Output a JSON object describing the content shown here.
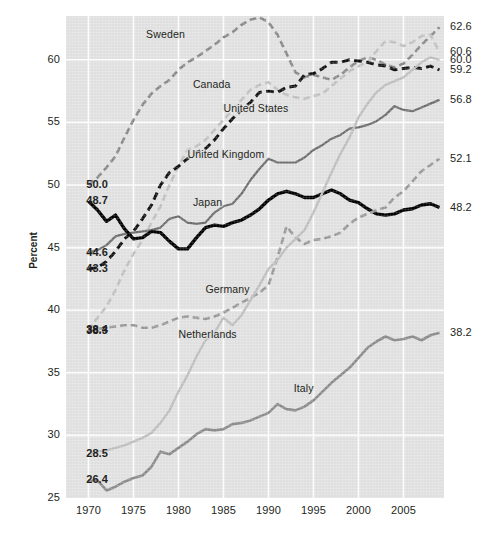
{
  "chart_data": {
    "type": "line",
    "title": "",
    "xlabel": "",
    "ylabel": "Percent",
    "xlim": [
      1967.5,
      2009.5
    ],
    "ylim": [
      25,
      63.5
    ],
    "xticks": [
      "1970",
      "1975",
      "1980",
      "1985",
      "1990",
      "1995",
      "2000",
      "2005"
    ],
    "xtick_values": [
      1970,
      1975,
      1980,
      1985,
      1990,
      1995,
      2000,
      2005
    ],
    "yticks": [
      "25",
      "30",
      "35",
      "40",
      "45",
      "50",
      "55",
      "60"
    ],
    "ytick_values": [
      25,
      30,
      35,
      40,
      45,
      50,
      55,
      60
    ],
    "grid": true,
    "legend": "inline-labels",
    "panel_color": "#e3e3e3",
    "grid_color": "#ffffff",
    "series": [
      {
        "name": "Sweden",
        "color": "#8a8a8a",
        "style": "dashed",
        "width": 2.6,
        "label_x": 1976.4,
        "label_y": 62.0,
        "start_label": "",
        "end_label": "62.6",
        "x": [
          1970,
          1971,
          1972,
          1973,
          1974,
          1975,
          1976,
          1977,
          1978,
          1979,
          1980,
          1981,
          1982,
          1983,
          1984,
          1985,
          1986,
          1987,
          1988,
          1989,
          1990,
          1991,
          1992,
          1993,
          1994,
          1995,
          1996,
          1997,
          1998,
          1999,
          2000,
          2001,
          2002,
          2003,
          2004,
          2005,
          2006,
          2007,
          2008,
          2009
        ],
        "values": [
          50.0,
          50.6,
          51.4,
          52.3,
          53.8,
          55.2,
          56.4,
          57.3,
          57.9,
          58.4,
          59.2,
          59.8,
          60.2,
          60.7,
          61.2,
          61.8,
          62.2,
          62.8,
          63.2,
          63.4,
          63.0,
          62.0,
          60.5,
          59.0,
          58.6,
          58.8,
          58.6,
          58.4,
          58.8,
          59.4,
          59.9,
          60.2,
          60.0,
          59.6,
          59.4,
          59.7,
          60.4,
          61.2,
          61.9,
          62.6
        ]
      },
      {
        "name": "Canada",
        "color": "#c2c2c2",
        "style": "dashed",
        "width": 2.6,
        "label_x": 1981.6,
        "label_y": 58.0,
        "start_label": "38.4",
        "end_label": "60.6",
        "x": [
          1970,
          1971,
          1972,
          1973,
          1974,
          1975,
          1976,
          1977,
          1978,
          1979,
          1980,
          1981,
          1982,
          1983,
          1984,
          1985,
          1986,
          1987,
          1988,
          1989,
          1990,
          1991,
          1992,
          1993,
          1994,
          1995,
          1996,
          1997,
          1998,
          1999,
          2000,
          2001,
          2002,
          2003,
          2004,
          2005,
          2006,
          2007,
          2008,
          2009
        ],
        "values": [
          38.4,
          39.4,
          40.3,
          41.6,
          43.2,
          44.5,
          45.6,
          47.0,
          48.3,
          50.0,
          51.5,
          52.8,
          53.1,
          53.6,
          54.4,
          55.2,
          56.0,
          56.8,
          57.6,
          58.0,
          58.2,
          57.6,
          57.2,
          57.0,
          56.9,
          57.1,
          57.3,
          57.9,
          58.5,
          59.1,
          59.5,
          59.8,
          60.7,
          61.5,
          61.4,
          61.1,
          61.4,
          61.9,
          62.0,
          60.6
        ]
      },
      {
        "name": "United States",
        "color": "#111111",
        "style": "dashed",
        "width": 3.0,
        "label_x": 1985.0,
        "label_y": 56.1,
        "start_label": "43.3",
        "end_label": "59.2",
        "x": [
          1970,
          1971,
          1972,
          1973,
          1974,
          1975,
          1976,
          1977,
          1978,
          1979,
          1980,
          1981,
          1982,
          1983,
          1984,
          1985,
          1986,
          1987,
          1988,
          1989,
          1990,
          1991,
          1992,
          1993,
          1994,
          1995,
          1996,
          1997,
          1998,
          1999,
          2000,
          2001,
          2002,
          2003,
          2004,
          2005,
          2006,
          2007,
          2008,
          2009
        ],
        "values": [
          43.3,
          43.4,
          43.9,
          44.7,
          45.7,
          46.3,
          47.3,
          48.4,
          50.0,
          51.0,
          51.5,
          52.1,
          52.6,
          52.9,
          53.6,
          54.5,
          55.3,
          56.0,
          56.6,
          57.4,
          57.5,
          57.4,
          57.8,
          57.9,
          58.8,
          58.9,
          59.3,
          59.8,
          59.8,
          60.0,
          59.9,
          59.8,
          59.6,
          59.5,
          59.2,
          59.3,
          59.4,
          59.3,
          59.5,
          59.2
        ]
      },
      {
        "name": "United Kingdom",
        "color": "#6e6e6e",
        "style": "solid",
        "width": 2.2,
        "label_x": 1981.0,
        "label_y": 52.4,
        "start_label": "44.6",
        "end_label": "56.8",
        "x": [
          1970,
          1971,
          1972,
          1973,
          1974,
          1975,
          1976,
          1977,
          1978,
          1979,
          1980,
          1981,
          1982,
          1983,
          1984,
          1985,
          1986,
          1987,
          1988,
          1989,
          1990,
          1991,
          1992,
          1993,
          1994,
          1995,
          1996,
          1997,
          1998,
          1999,
          2000,
          2001,
          2002,
          2003,
          2004,
          2005,
          2006,
          2007,
          2008,
          2009
        ],
        "values": [
          44.6,
          44.8,
          45.2,
          45.9,
          46.1,
          46.2,
          46.3,
          46.4,
          46.6,
          47.3,
          47.5,
          47.0,
          46.9,
          47.0,
          47.8,
          48.3,
          48.5,
          49.3,
          50.4,
          51.3,
          52.1,
          51.8,
          51.8,
          51.8,
          52.2,
          52.8,
          53.2,
          53.7,
          54.0,
          54.5,
          54.6,
          54.8,
          55.1,
          55.6,
          56.3,
          56.0,
          55.9,
          56.2,
          56.5,
          56.8
        ]
      },
      {
        "name": "Japan",
        "color": "#000000",
        "style": "solid",
        "width": 3.4,
        "label_x": 1981.6,
        "label_y": 48.6,
        "start_label": "48.7",
        "end_label": "48.2",
        "x": [
          1970,
          1971,
          1972,
          1973,
          1974,
          1975,
          1976,
          1977,
          1978,
          1979,
          1980,
          1981,
          1982,
          1983,
          1984,
          1985,
          1986,
          1987,
          1988,
          1989,
          1990,
          1991,
          1992,
          1993,
          1994,
          1995,
          1996,
          1997,
          1998,
          1999,
          2000,
          2001,
          2002,
          2003,
          2004,
          2005,
          2006,
          2007,
          2008,
          2009
        ],
        "values": [
          48.7,
          48.0,
          47.1,
          47.6,
          46.5,
          45.7,
          45.8,
          46.3,
          46.2,
          45.5,
          44.9,
          44.9,
          45.8,
          46.6,
          46.8,
          46.7,
          47.0,
          47.2,
          47.6,
          48.1,
          48.8,
          49.3,
          49.5,
          49.3,
          49.0,
          49.0,
          49.3,
          49.6,
          49.3,
          48.8,
          48.6,
          48.1,
          47.7,
          47.6,
          47.7,
          48.0,
          48.1,
          48.4,
          48.5,
          48.2
        ]
      },
      {
        "name": "Germany",
        "color": "#9a9a9a",
        "style": "dashed",
        "width": 2.6,
        "label_x": 1983.0,
        "label_y": 41.6,
        "start_label": "38.3",
        "end_label": "52.1",
        "x": [
          1970,
          1971,
          1972,
          1973,
          1974,
          1975,
          1976,
          1977,
          1978,
          1979,
          1980,
          1981,
          1982,
          1983,
          1984,
          1985,
          1986,
          1987,
          1988,
          1989,
          1990,
          1991,
          1992,
          1993,
          1994,
          1995,
          1996,
          1997,
          1998,
          1999,
          2000,
          2001,
          2002,
          2003,
          2004,
          2005,
          2006,
          2007,
          2008,
          2009
        ],
        "values": [
          38.3,
          38.5,
          38.6,
          38.7,
          38.8,
          38.8,
          38.6,
          38.6,
          38.8,
          39.1,
          39.4,
          39.5,
          39.4,
          39.3,
          39.5,
          39.8,
          40.2,
          40.6,
          41.0,
          41.4,
          42.0,
          44.2,
          46.7,
          45.8,
          45.3,
          45.6,
          45.7,
          45.9,
          46.2,
          46.9,
          47.4,
          47.7,
          48.0,
          48.2,
          49.0,
          49.5,
          50.3,
          51.1,
          51.6,
          52.1
        ]
      },
      {
        "name": "Netherlands",
        "color": "#c0c0c0",
        "style": "solid",
        "width": 2.4,
        "label_x": 1980.0,
        "label_y": 38.0,
        "start_label": "28.5",
        "end_label": "60.0",
        "x": [
          1970,
          1971,
          1972,
          1973,
          1974,
          1975,
          1976,
          1977,
          1978,
          1979,
          1980,
          1981,
          1982,
          1983,
          1984,
          1985,
          1986,
          1987,
          1988,
          1989,
          1990,
          1991,
          1992,
          1993,
          1994,
          1995,
          1996,
          1997,
          1998,
          1999,
          2000,
          2001,
          2002,
          2003,
          2004,
          2005,
          2006,
          2007,
          2008,
          2009
        ],
        "values": [
          28.5,
          28.7,
          28.8,
          29.0,
          29.2,
          29.5,
          29.8,
          30.2,
          31.0,
          32.0,
          33.5,
          34.8,
          36.3,
          37.6,
          38.2,
          39.4,
          38.8,
          39.6,
          40.8,
          42.0,
          43.3,
          44.0,
          45.0,
          45.7,
          46.4,
          47.8,
          49.4,
          51.0,
          52.5,
          53.8,
          55.4,
          56.5,
          57.4,
          58.0,
          58.3,
          58.6,
          59.2,
          59.8,
          60.2,
          60.0
        ]
      },
      {
        "name": "Italy",
        "color": "#8c8c8c",
        "style": "solid",
        "width": 2.6,
        "label_x": 1992.8,
        "label_y": 33.7,
        "start_label": "26.4",
        "end_label": "38.2",
        "x": [
          1970,
          1971,
          1972,
          1973,
          1974,
          1975,
          1976,
          1977,
          1978,
          1979,
          1980,
          1981,
          1982,
          1983,
          1984,
          1985,
          1986,
          1987,
          1988,
          1989,
          1990,
          1991,
          1992,
          1993,
          1994,
          1995,
          1996,
          1997,
          1998,
          1999,
          2000,
          2001,
          2002,
          2003,
          2004,
          2005,
          2006,
          2007,
          2008,
          2009
        ],
        "values": [
          26.4,
          26.4,
          25.6,
          25.9,
          26.3,
          26.6,
          26.8,
          27.5,
          28.7,
          28.5,
          29.0,
          29.5,
          30.1,
          30.5,
          30.4,
          30.5,
          30.9,
          31.0,
          31.2,
          31.5,
          31.8,
          32.5,
          32.1,
          32.0,
          32.3,
          32.8,
          33.5,
          34.2,
          34.8,
          35.4,
          36.2,
          37.0,
          37.5,
          37.9,
          37.6,
          37.7,
          37.9,
          37.6,
          38.0,
          38.2
        ]
      }
    ],
    "left_callouts": [
      {
        "label": "50.0",
        "value": 50.0
      },
      {
        "label": "48.7",
        "value": 48.7
      },
      {
        "label": "44.6",
        "value": 44.6
      },
      {
        "label": "43.3",
        "value": 43.3
      },
      {
        "label": "38.4",
        "value": 38.4
      },
      {
        "label": "38.3",
        "value": 38.3
      },
      {
        "label": "28.5",
        "value": 28.5
      },
      {
        "label": "26.4",
        "value": 26.4
      }
    ],
    "right_callouts": [
      {
        "label": "62.6",
        "value": 62.6
      },
      {
        "label": "60.6",
        "value": 60.6
      },
      {
        "label": "60.0",
        "value": 60.0
      },
      {
        "label": "59.2",
        "value": 59.2
      },
      {
        "label": "56.8",
        "value": 56.8
      },
      {
        "label": "52.1",
        "value": 52.1
      },
      {
        "label": "48.2",
        "value": 48.2
      },
      {
        "label": "38.2",
        "value": 38.2
      }
    ]
  }
}
